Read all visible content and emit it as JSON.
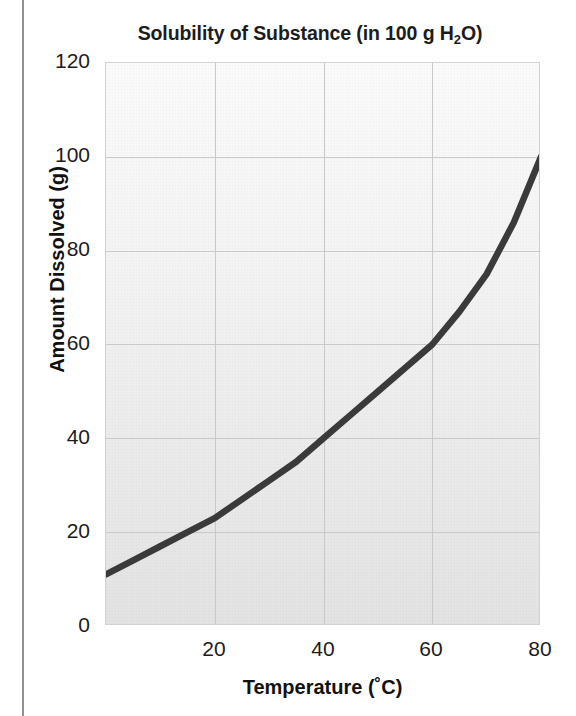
{
  "figure": {
    "background_color": "#ffffff",
    "plot_border_color": "#d2d2d2",
    "gridline_color": "#c9c9c9",
    "curve_color": "#3a3a3a"
  },
  "chart_data": {
    "type": "line",
    "title": "Solubility of Substance (in 100 g H",
    "title_sub": "2",
    "title_tail": "O)",
    "title_full": "Solubility of Substance (in 100 g H2O)",
    "xlabel": "Temperature (˚C)",
    "ylabel": "Amount Dissolved (g)",
    "xlim": [
      0,
      80
    ],
    "ylim": [
      0,
      120
    ],
    "xticks": [
      "20",
      "40",
      "60",
      "80"
    ],
    "xtick_values": [
      20,
      40,
      60,
      80
    ],
    "yticks": [
      "0",
      "20",
      "40",
      "60",
      "80",
      "100",
      "120"
    ],
    "ytick_values": [
      0,
      20,
      40,
      60,
      80,
      100,
      120
    ],
    "grid": true,
    "legend": false,
    "series": [
      {
        "name": "Solubility",
        "x": [
          0,
          5,
          10,
          15,
          20,
          25,
          30,
          35,
          40,
          45,
          50,
          55,
          60,
          65,
          70,
          75,
          80
        ],
        "values": [
          11,
          14,
          17,
          20,
          23,
          27,
          31,
          35,
          40,
          45,
          50,
          55,
          60,
          67,
          75,
          86,
          100
        ]
      }
    ]
  },
  "axis": {
    "x_tick_labels": [
      "20",
      "40",
      "60",
      "80"
    ],
    "y_tick_labels": [
      "0",
      "20",
      "40",
      "60",
      "80",
      "100",
      "120"
    ],
    "x_title": "Temperature (˚C)",
    "y_title": "Amount Dissolved (g)"
  }
}
